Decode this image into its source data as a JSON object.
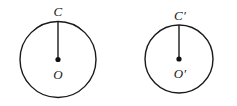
{
  "figure": {
    "background_color": "#ffffff",
    "stroke_color": "#1a1a1a",
    "width": 237,
    "height": 106,
    "shapes": [
      {
        "id": "left",
        "name": "circle-left",
        "center_label": "O",
        "top_label": "C",
        "cx": 58,
        "cy": 59.5,
        "r": 38,
        "stroke_width": 1.4,
        "dot_r": 2.6,
        "center_label_x": 58,
        "center_label_y": 74,
        "top_label_x": 58,
        "top_label_y": 11,
        "label_font_size": 13
      },
      {
        "id": "right",
        "name": "circle-right",
        "center_label": "O′",
        "top_label": "C′",
        "cx": 179,
        "cy": 59,
        "r": 34,
        "stroke_width": 1.4,
        "dot_r": 2.6,
        "center_label_x": 180,
        "center_label_y": 73,
        "top_label_x": 180,
        "top_label_y": 15,
        "label_font_size": 13
      }
    ]
  }
}
